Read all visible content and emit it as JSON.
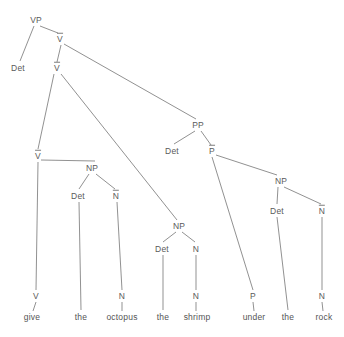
{
  "diagram": {
    "type": "syntax-tree",
    "sentence": "give the octopus the shrimp under the rock",
    "line_color": "#7d7d7d",
    "text_color": "#5a5a5a",
    "background": "#ffffff",
    "width": 344,
    "height": 337,
    "nodes": [
      {
        "id": "vp",
        "label": "VP",
        "bar": false,
        "x": 36,
        "y": 20
      },
      {
        "id": "det1",
        "label": "Det",
        "bar": false,
        "x": 18,
        "y": 68
      },
      {
        "id": "vbar1",
        "label": "V",
        "bar": true,
        "x": 60,
        "y": 39
      },
      {
        "id": "vbar2",
        "label": "V",
        "bar": true,
        "x": 57,
        "y": 68
      },
      {
        "id": "vbar3",
        "label": "V",
        "bar": true,
        "x": 38,
        "y": 156
      },
      {
        "id": "np1",
        "label": "NP",
        "bar": false,
        "x": 92,
        "y": 168
      },
      {
        "id": "det2",
        "label": "Det",
        "bar": false,
        "x": 78,
        "y": 196
      },
      {
        "id": "nbar1",
        "label": "N",
        "bar": true,
        "x": 116,
        "y": 196
      },
      {
        "id": "np2",
        "label": "NP",
        "bar": false,
        "x": 179,
        "y": 226
      },
      {
        "id": "det3",
        "label": "Det",
        "bar": false,
        "x": 162,
        "y": 249
      },
      {
        "id": "n2",
        "label": "N",
        "bar": false,
        "x": 196,
        "y": 249
      },
      {
        "id": "pp",
        "label": "PP",
        "bar": false,
        "x": 198,
        "y": 125
      },
      {
        "id": "det4",
        "label": "Det",
        "bar": false,
        "x": 172,
        "y": 151
      },
      {
        "id": "pbar",
        "label": "P",
        "bar": true,
        "x": 212,
        "y": 151
      },
      {
        "id": "np3",
        "label": "NP",
        "bar": false,
        "x": 281,
        "y": 181
      },
      {
        "id": "det5",
        "label": "Det",
        "bar": false,
        "x": 277,
        "y": 211
      },
      {
        "id": "nbar2",
        "label": "N",
        "bar": true,
        "x": 322,
        "y": 211
      },
      {
        "id": "v-leaf",
        "label": "V",
        "bar": false,
        "x": 36,
        "y": 296
      },
      {
        "id": "n-leaf1",
        "label": "N",
        "bar": false,
        "x": 122,
        "y": 296
      },
      {
        "id": "n-leaf2",
        "label": "N",
        "bar": false,
        "x": 196,
        "y": 296
      },
      {
        "id": "p-leaf",
        "label": "P",
        "bar": false,
        "x": 253,
        "y": 296
      },
      {
        "id": "n-leaf3",
        "label": "N",
        "bar": false,
        "x": 322,
        "y": 296
      }
    ],
    "words": [
      {
        "id": "w-give",
        "label": "give",
        "x": 32,
        "y": 317
      },
      {
        "id": "w-the1",
        "label": "the",
        "x": 81,
        "y": 317
      },
      {
        "id": "w-octopus",
        "label": "octopus",
        "x": 122,
        "y": 317
      },
      {
        "id": "w-the2",
        "label": "the",
        "x": 163,
        "y": 317
      },
      {
        "id": "w-shrimp",
        "label": "shrimp",
        "x": 197,
        "y": 317
      },
      {
        "id": "w-under",
        "label": "under",
        "x": 254,
        "y": 317
      },
      {
        "id": "w-the3",
        "label": "the",
        "x": 288,
        "y": 317
      },
      {
        "id": "w-rock",
        "label": "rock",
        "x": 324,
        "y": 317
      }
    ],
    "edges": [
      {
        "from": "vp",
        "to": "det1",
        "x1": 34,
        "y1": 26,
        "x2": 20,
        "y2": 61
      },
      {
        "from": "vp",
        "to": "vbar1",
        "x1": 40,
        "y1": 26,
        "x2": 58,
        "y2": 33
      },
      {
        "from": "vbar1",
        "to": "vbar2",
        "x1": 61,
        "y1": 45,
        "x2": 57,
        "y2": 62
      },
      {
        "from": "vbar1",
        "to": "pp",
        "x1": 64,
        "y1": 44,
        "x2": 196,
        "y2": 119
      },
      {
        "from": "vbar2",
        "to": "vbar3",
        "x1": 54,
        "y1": 74,
        "x2": 38,
        "y2": 149
      },
      {
        "from": "vbar2",
        "to": "np2",
        "x1": 61,
        "y1": 74,
        "x2": 177,
        "y2": 220
      },
      {
        "from": "vbar3",
        "to": "np1",
        "x1": 41,
        "y1": 160,
        "x2": 95,
        "y2": 161
      },
      {
        "from": "vbar3",
        "to": "v-leaf",
        "x1": 38,
        "y1": 162,
        "x2": 36,
        "y2": 290
      },
      {
        "from": "np1",
        "to": "det2",
        "x1": 89,
        "y1": 174,
        "x2": 79,
        "y2": 189
      },
      {
        "from": "np1",
        "to": "nbar1",
        "x1": 96,
        "y1": 174,
        "x2": 115,
        "y2": 189
      },
      {
        "from": "det2",
        "to": "w-the1",
        "x1": 79,
        "y1": 202,
        "x2": 81,
        "y2": 310
      },
      {
        "from": "nbar1",
        "to": "n-leaf1",
        "x1": 117,
        "y1": 202,
        "x2": 122,
        "y2": 290
      },
      {
        "from": "np2",
        "to": "det3",
        "x1": 176,
        "y1": 232,
        "x2": 163,
        "y2": 242
      },
      {
        "from": "np2",
        "to": "n2",
        "x1": 182,
        "y1": 232,
        "x2": 195,
        "y2": 242
      },
      {
        "from": "det3",
        "to": "w-the2",
        "x1": 163,
        "y1": 255,
        "x2": 163,
        "y2": 310
      },
      {
        "from": "n2",
        "to": "n-leaf2",
        "x1": 196,
        "y1": 255,
        "x2": 196,
        "y2": 290
      },
      {
        "from": "pp",
        "to": "det4",
        "x1": 195,
        "y1": 131,
        "x2": 174,
        "y2": 144
      },
      {
        "from": "pp",
        "to": "pbar",
        "x1": 201,
        "y1": 131,
        "x2": 211,
        "y2": 145
      },
      {
        "from": "pbar",
        "to": "p-leaf",
        "x1": 212,
        "y1": 157,
        "x2": 253,
        "y2": 290
      },
      {
        "from": "pbar",
        "to": "np3",
        "x1": 216,
        "y1": 155,
        "x2": 277,
        "y2": 175
      },
      {
        "from": "np3",
        "to": "det5",
        "x1": 278,
        "y1": 187,
        "x2": 277,
        "y2": 204
      },
      {
        "from": "np3",
        "to": "nbar2",
        "x1": 284,
        "y1": 187,
        "x2": 321,
        "y2": 204
      },
      {
        "from": "det5",
        "to": "w-the3",
        "x1": 277,
        "y1": 217,
        "x2": 288,
        "y2": 310
      },
      {
        "from": "nbar2",
        "to": "n-leaf3",
        "x1": 322,
        "y1": 217,
        "x2": 322,
        "y2": 290
      },
      {
        "from": "v-leaf",
        "to": "w-give",
        "x1": 36,
        "y1": 302,
        "x2": 33,
        "y2": 311
      },
      {
        "from": "n-leaf1",
        "to": "w-octopus",
        "x1": 122,
        "y1": 302,
        "x2": 122,
        "y2": 311
      },
      {
        "from": "n-leaf2",
        "to": "w-shrimp",
        "x1": 196,
        "y1": 302,
        "x2": 196,
        "y2": 311
      },
      {
        "from": "p-leaf",
        "to": "w-under",
        "x1": 253,
        "y1": 302,
        "x2": 254,
        "y2": 311
      },
      {
        "from": "n-leaf3",
        "to": "w-rock",
        "x1": 322,
        "y1": 302,
        "x2": 323,
        "y2": 311
      }
    ]
  }
}
